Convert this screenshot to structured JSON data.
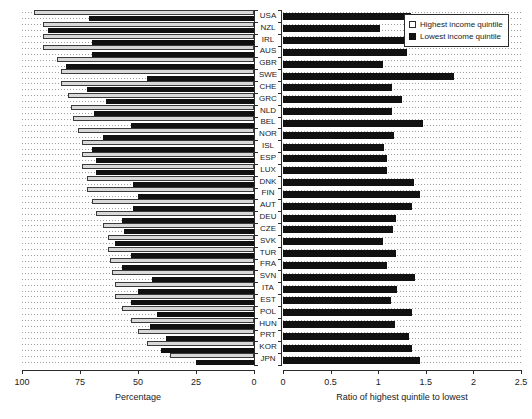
{
  "legend": {
    "position": "top-right",
    "items": [
      {
        "label": "Highest income quintile",
        "swatch": "white-square",
        "color": "#ffffff"
      },
      {
        "label": "Lowest income quintile",
        "swatch": "black-square",
        "color": "#111111"
      }
    ]
  },
  "left_axis": {
    "title": "Percentage",
    "ticks": [
      "100",
      "75",
      "50",
      "25",
      "0"
    ],
    "tick_values": [
      100,
      75,
      50,
      25,
      0
    ],
    "reversed": true
  },
  "right_axis": {
    "title": "Ratio of highest quintile to lowest",
    "ticks": [
      "0",
      "0.5",
      "1",
      "1.5",
      "2",
      "2.5"
    ],
    "tick_values": [
      0,
      0.5,
      1,
      1.5,
      2,
      2.5
    ],
    "reversed": false
  },
  "chart_data": [
    {
      "type": "bar",
      "id": "percentage-panel",
      "orientation": "horizontal",
      "title": "",
      "xlabel": "Percentage",
      "ylabel": "",
      "xlim": [
        100,
        0
      ],
      "grid": true,
      "legend": [
        "Highest income quintile",
        "Lowest income quintile"
      ],
      "categories": [
        "USA",
        "NZL",
        "IRL",
        "AUS",
        "GBR",
        "SWE",
        "CHE",
        "GRC",
        "NLD",
        "BEL",
        "NOR",
        "ISL",
        "ESP",
        "LUX",
        "DNK",
        "FIN",
        "AUT",
        "DEU",
        "CZE",
        "SVK",
        "TUR",
        "FRA",
        "SVN",
        "ITA",
        "EST",
        "POL",
        "HUN",
        "PRT",
        "KOR",
        "JPN"
      ],
      "series": [
        {
          "name": "Highest income quintile",
          "values": [
            95,
            91,
            91,
            91,
            85,
            83,
            83,
            80,
            79,
            78,
            76,
            74,
            74,
            74,
            72,
            72,
            70,
            68,
            65,
            63,
            63,
            62,
            61,
            60,
            60,
            57,
            53,
            50,
            46,
            36
          ]
        },
        {
          "name": "Lowest income quintile",
          "values": [
            71,
            89,
            70,
            70,
            81,
            46,
            72,
            64,
            69,
            53,
            65,
            70,
            68,
            68,
            52,
            50,
            52,
            57,
            56,
            60,
            53,
            57,
            44,
            50,
            53,
            42,
            45,
            38,
            40,
            25
          ]
        }
      ]
    },
    {
      "type": "bar",
      "id": "ratio-panel",
      "orientation": "horizontal",
      "title": "",
      "xlabel": "Ratio of highest quintile to lowest",
      "ylabel": "",
      "xlim": [
        0,
        2.5
      ],
      "grid": true,
      "categories": [
        "USA",
        "NZL",
        "IRL",
        "AUS",
        "GBR",
        "SWE",
        "CHE",
        "GRC",
        "NLD",
        "BEL",
        "NOR",
        "ISL",
        "ESP",
        "LUX",
        "DNK",
        "FIN",
        "AUT",
        "DEU",
        "CZE",
        "SVK",
        "TUR",
        "FRA",
        "SVN",
        "ITA",
        "EST",
        "POL",
        "HUN",
        "PRT",
        "KOR",
        "JPN"
      ],
      "values": [
        1.34,
        1.02,
        1.3,
        1.3,
        1.05,
        1.8,
        1.15,
        1.25,
        1.14,
        1.47,
        1.17,
        1.06,
        1.09,
        1.09,
        1.38,
        1.44,
        1.35,
        1.19,
        1.16,
        1.05,
        1.19,
        1.09,
        1.39,
        1.2,
        1.13,
        1.36,
        1.18,
        1.32,
        1.35,
        1.44
      ]
    }
  ]
}
